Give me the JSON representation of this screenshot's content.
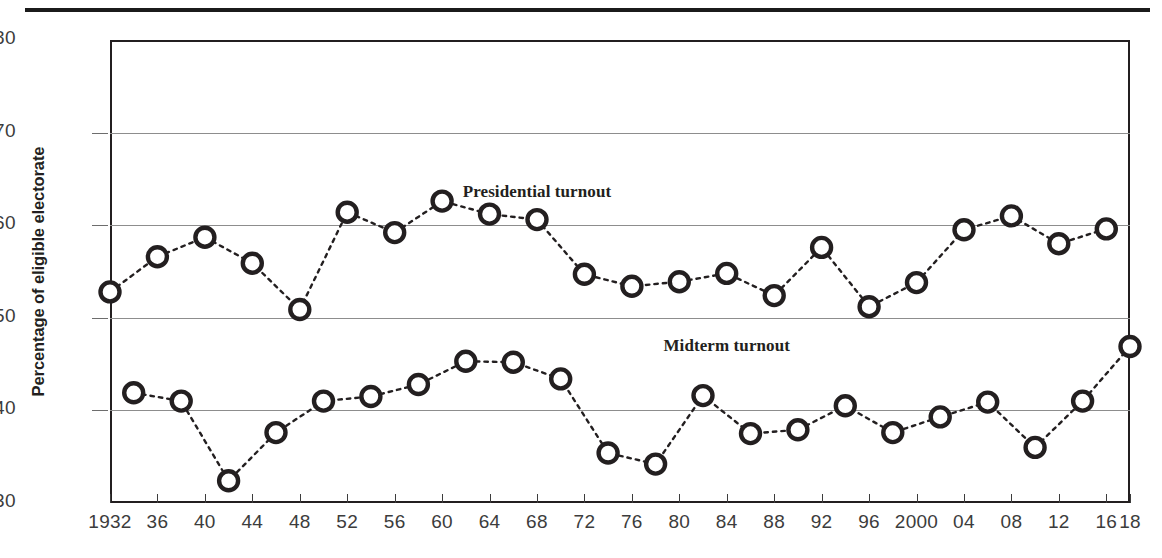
{
  "chart_data": {
    "type": "line",
    "title": "",
    "xlabel": "",
    "ylabel": "Percentage of eligible electorate",
    "ylim": [
      30,
      80
    ],
    "yticks": [
      30,
      40,
      50,
      60,
      70,
      80
    ],
    "grid": "horizontal gridlines at 40, 50, 60, 70",
    "legend_position": "inline annotations on plot",
    "xlim": [
      1932,
      2018
    ],
    "xtick_values": [
      1932,
      1936,
      1940,
      1944,
      1948,
      1952,
      1956,
      1960,
      1964,
      1968,
      1972,
      1976,
      1980,
      1984,
      1988,
      1992,
      1996,
      2000,
      2004,
      2008,
      2012,
      2016,
      2018
    ],
    "xtick_labels": [
      "1932",
      "36",
      "40",
      "44",
      "48",
      "52",
      "56",
      "60",
      "64",
      "68",
      "72",
      "76",
      "80",
      "84",
      "88",
      "92",
      "96",
      "2000",
      "04",
      "08",
      "12",
      "16",
      "18"
    ],
    "series": [
      {
        "name": "Presidential turnout",
        "x": [
          1932,
          1936,
          1940,
          1944,
          1948,
          1952,
          1956,
          1960,
          1964,
          1968,
          1972,
          1976,
          1980,
          1984,
          1988,
          1992,
          1996,
          2000,
          2004,
          2008,
          2012,
          2016
        ],
        "values": [
          52.8,
          56.6,
          58.7,
          55.9,
          50.9,
          61.4,
          59.2,
          62.6,
          61.2,
          60.6,
          54.7,
          53.4,
          53.9,
          54.8,
          52.4,
          57.6,
          51.2,
          53.8,
          59.5,
          61.0,
          58.0,
          59.6
        ]
      },
      {
        "name": "Midterm turnout",
        "x": [
          1934,
          1938,
          1942,
          1946,
          1950,
          1954,
          1958,
          1962,
          1966,
          1970,
          1974,
          1978,
          1982,
          1986,
          1990,
          1994,
          1998,
          2002,
          2006,
          2010,
          2014,
          2018
        ],
        "values": [
          41.9,
          41.0,
          32.4,
          37.6,
          41.0,
          41.5,
          42.8,
          45.3,
          45.2,
          43.4,
          35.4,
          34.2,
          41.6,
          37.5,
          37.9,
          40.5,
          37.6,
          39.3,
          40.9,
          36.0,
          41.0,
          46.9
        ]
      }
    ],
    "annotations": [
      {
        "text": "Presidential turnout",
        "x": 1968,
        "y": 63.5
      },
      {
        "text": "Midterm turnout",
        "x": 1984,
        "y": 46.8
      }
    ],
    "style": {
      "marker": "open-circle",
      "line_style": "dotted",
      "line_color": "#231f20",
      "marker_edge_color": "#231f20",
      "marker_face_color": "#ffffff",
      "gridline_color": "#8d8d8d",
      "axis_color": "#231f20",
      "text_color": "#3c3c3c",
      "background": "#ffffff"
    }
  },
  "axis": {
    "y_title": "Percentage of eligible electorate"
  }
}
